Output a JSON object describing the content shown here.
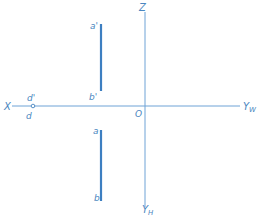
{
  "diagram": {
    "type": "orthographic-projection",
    "colors": {
      "axis": "#6fa3d6",
      "segment": "#3d7fc1",
      "label": "#4a86c0",
      "background": "#ffffff"
    },
    "axes": {
      "x_label": "X",
      "yw_label": "Y",
      "yw_sub": "W",
      "z_label": "Z",
      "yh_label": "Y",
      "yh_sub": "H",
      "origin_label": "O"
    },
    "point_d": {
      "upper_label": "d'",
      "lower_label": "d"
    },
    "segment_front": {
      "top_label": "a'",
      "bottom_label": "b'"
    },
    "segment_top": {
      "top_label": "a",
      "bottom_label": "b"
    }
  }
}
